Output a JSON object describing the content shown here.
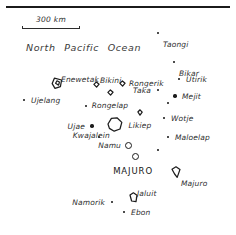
{
  "map": {
    "region_label": "North  Pacific  Ocean",
    "scale": {
      "label": "300 km",
      "value": 300,
      "unit": "km"
    },
    "capital_name": "MAJURO",
    "places": [
      {
        "name": "Taongi",
        "x": 158,
        "y": 33,
        "marker": "speck",
        "label_pos": "lbl-br"
      },
      {
        "name": "Bikar",
        "x": 174,
        "y": 62,
        "marker": "speck",
        "label_pos": "lbl-br"
      },
      {
        "name": "Enewetak",
        "x": 57,
        "y": 83,
        "marker": "atoll-enewetak",
        "label_pos": "lbl-ar"
      },
      {
        "name": "Bikini",
        "x": 96,
        "y": 84,
        "marker": "atoll-small",
        "label_pos": "lbl-ar"
      },
      {
        "name": "Rongerik",
        "x": 122,
        "y": 83,
        "marker": "atoll-small",
        "label_pos": "lbl-right"
      },
      {
        "name": "Utirik",
        "x": 179,
        "y": 79,
        "marker": "speck",
        "label_pos": "lbl-right"
      },
      {
        "name": "Rongelap",
        "x": 110,
        "y": 92,
        "marker": "atoll-small",
        "label_pos": "lbl-below"
      },
      {
        "name": "Taka",
        "x": 158,
        "y": 90,
        "marker": "speck",
        "label_pos": "lbl-left"
      },
      {
        "name": "Mejit",
        "x": 175,
        "y": 96,
        "marker": "dot-lg",
        "label_pos": "lbl-right"
      },
      {
        "name": "Ujelang",
        "x": 24,
        "y": 100,
        "marker": "speck",
        "label_pos": "lbl-right"
      },
      {
        "name": "Ailuk",
        "x": 168,
        "y": 103,
        "marker": "speck",
        "label_pos": "none"
      },
      {
        "name": "Wotho",
        "x": 86,
        "y": 106,
        "marker": "speck",
        "label_pos": "none"
      },
      {
        "name": "Likiep",
        "x": 140,
        "y": 112,
        "marker": "atoll-tiny",
        "label_pos": "lbl-below"
      },
      {
        "name": "Kwajalein",
        "x": 115,
        "y": 124,
        "marker": "atoll-kwajalein",
        "label_pos": "lbl-bl"
      },
      {
        "name": "Wotje",
        "x": 164,
        "y": 118,
        "marker": "speck",
        "label_pos": "lbl-right"
      },
      {
        "name": "Ujae",
        "x": 92,
        "y": 126,
        "marker": "dot-lg",
        "label_pos": "lbl-left"
      },
      {
        "name": "Maloelap",
        "x": 168,
        "y": 137,
        "marker": "speck",
        "label_pos": "lbl-right"
      },
      {
        "name": "Lae",
        "x": 99,
        "y": 137,
        "marker": "speck",
        "label_pos": "none"
      },
      {
        "name": "Namu",
        "x": 128,
        "y": 145,
        "marker": "ring",
        "label_pos": "lbl-left"
      },
      {
        "name": "Aur",
        "x": 158,
        "y": 150,
        "marker": "speck",
        "label_pos": "none"
      },
      {
        "name": "Arno",
        "x": 135,
        "y": 156,
        "marker": "ring",
        "label_pos": "none"
      },
      {
        "name": "Majuro",
        "x": 176,
        "y": 172,
        "marker": "atoll-majuro",
        "label_pos": "lbl-br"
      },
      {
        "name": "Jaluit",
        "x": 133,
        "y": 197,
        "marker": "atoll-jaluit",
        "label_pos": "lbl-ar"
      },
      {
        "name": "Namorik",
        "x": 112,
        "y": 202,
        "marker": "speck",
        "label_pos": "lbl-left"
      },
      {
        "name": "Ebon",
        "x": 124,
        "y": 212,
        "marker": "speck",
        "label_pos": "lbl-right"
      }
    ],
    "capital": {
      "name": "MAJURO",
      "x": 160,
      "y": 171,
      "label_pos": "lbl-left"
    }
  }
}
